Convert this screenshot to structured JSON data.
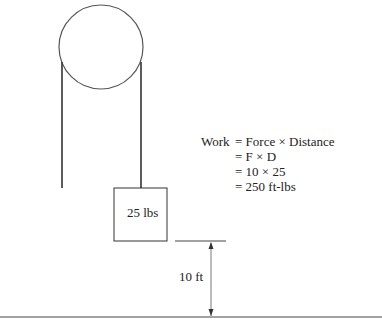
{
  "diagram": {
    "type": "pulley-work-illustration",
    "weight_label": "25 lbs",
    "distance_label": "10 ft",
    "equation": {
      "lhs": "Work",
      "lines": [
        "= Force × Distance",
        "= F × D",
        "= 10 × 25",
        "= 250 ft-lbs"
      ]
    },
    "colors": {
      "stroke": "#333333",
      "background": "#ffffff"
    }
  }
}
